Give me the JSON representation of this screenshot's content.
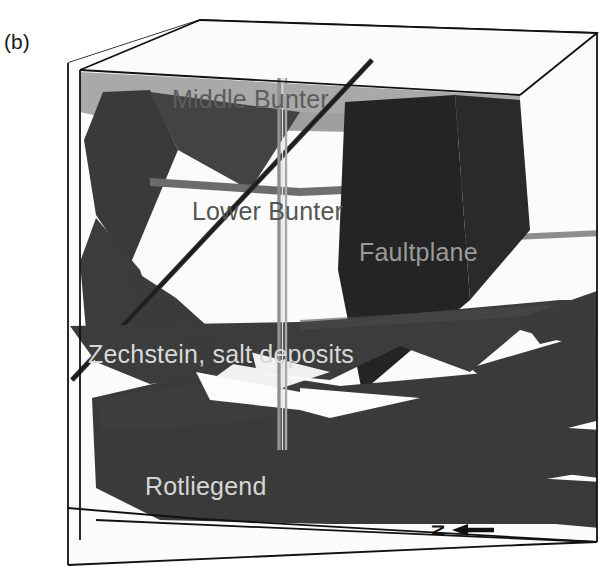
{
  "figure": {
    "panel_label": "(b)",
    "type": "3d-geological-block-model",
    "background_color": "#ffffff",
    "outline_color": "#111111"
  },
  "labels": {
    "middle_bunter": "Middle Bunter",
    "lower_bunter": "Lower Bunter",
    "faultplane": "Faultplane",
    "zechstein": "Zechstein, salt deposits",
    "rotliegend": "Rotliegend"
  },
  "north_arrow": {
    "letter": "N",
    "direction": "left",
    "name": "north-arrow"
  },
  "horizons": [
    {
      "name": "Middle Bunter",
      "fill": "#a8a8a8",
      "label_color": "#5d5d5d"
    },
    {
      "name": "Lower Bunter",
      "fill": "#6b6b6b",
      "label_color": "#555555"
    },
    {
      "name": "Zechstein, salt deposits",
      "fill": "#3c3c3c",
      "label_color": "#d9d9d9"
    },
    {
      "name": "Rotliegend",
      "fill": "#3a3a3a",
      "label_color": "#d5d5d5"
    }
  ],
  "features": {
    "faultplane": {
      "fill": "#242424",
      "label_color": "#9a9a9a"
    },
    "wellbore": {
      "color": "#8a8a8a",
      "orientation": "vertical"
    },
    "top_surface": {
      "description": "satellite map with roads",
      "fill": "#fdfdfd"
    }
  },
  "colors": {
    "outline": "#111111",
    "middle_bunter": "#a8a8a8",
    "lower_bunter": "#6b6b6b",
    "zechstein": "#3c3c3c",
    "rotliegend": "#3a3a3a",
    "faultplane": "#242424",
    "map_road": "#6e6e6e",
    "map_dark": "#4a4a4a",
    "background": "#ffffff"
  }
}
